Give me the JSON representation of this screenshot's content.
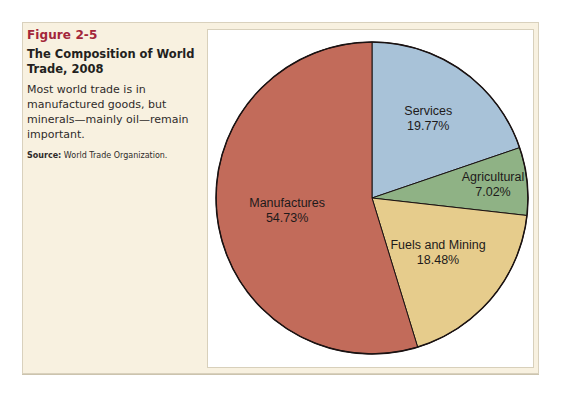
{
  "caption": {
    "figure_number": "Figure 2-5",
    "title": "The Composition of World Trade, 2008",
    "description": "Most world trade is in manufactured goods, but minerals—mainly oil—remain important.",
    "source_label": "Source:",
    "source_text": "World Trade Organization."
  },
  "colors": {
    "outline": "#1a1212",
    "background_box": "#f8f1e0",
    "figure_number": "#a3263a"
  },
  "chart_data": {
    "type": "pie",
    "title": "The Composition of World Trade, 2008",
    "start_angle_deg": 0,
    "direction": "clockwise",
    "categories": [
      "Services",
      "Agricultural",
      "Fuels and Mining",
      "Manufactures"
    ],
    "values": [
      19.77,
      7.02,
      18.48,
      54.73
    ],
    "unit": "%",
    "labels": [
      "Services\n19.77%",
      "Agricultural\n7.02%",
      "Fuels and Mining\n18.48%",
      "Manufactures\n54.73%"
    ],
    "slice_colors": [
      "#a8c2d8",
      "#8fb285",
      "#e6cc8c",
      "#c26b5a"
    ],
    "source": "World Trade Organization",
    "legend": "none (labels inside slices)"
  }
}
